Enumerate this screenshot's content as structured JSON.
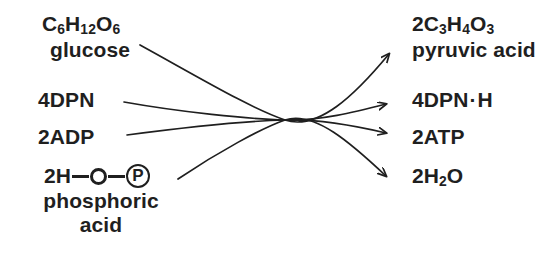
{
  "figure": {
    "type": "reaction-diagram",
    "background_color": "#ffffff",
    "ink_color": "#1f1f1f"
  },
  "reactants": [
    {
      "id": "glucose",
      "formula_parts": [
        "C",
        "6",
        "H",
        "12",
        "O",
        "6"
      ],
      "formula_plain": "C6H12O6",
      "name": "glucose"
    },
    {
      "id": "dpn",
      "formula_plain": "4DPN",
      "name": ""
    },
    {
      "id": "adp",
      "formula_plain": "2ADP",
      "name": ""
    },
    {
      "id": "phosphoric-acid",
      "formula_plain": "2H-O-(P)",
      "lead": "2H",
      "circle_o": "O",
      "circle_p": "P",
      "name_line1": "phosphoric",
      "name_line2": "acid"
    }
  ],
  "products": [
    {
      "id": "pyruvic-acid",
      "formula_parts": [
        "2C",
        "3",
        "H",
        "4",
        "O",
        "3"
      ],
      "formula_plain": "2C3H4O3",
      "name": "pyruvic acid"
    },
    {
      "id": "dpn-h",
      "formula_plain": "4DPN·H",
      "prefix": "4DPN",
      "dot": "·",
      "suffix": "H",
      "name": ""
    },
    {
      "id": "atp",
      "formula_plain": "2ATP",
      "name": ""
    },
    {
      "id": "water",
      "prefix": "2H",
      "sub": "2",
      "suffix": "O",
      "formula_plain": "2H2O",
      "name": ""
    }
  ],
  "arrows": [
    {
      "id": "arrow-glucose-to-pyruvic",
      "from": "glucose",
      "to": "pyruvic-acid"
    },
    {
      "id": "arrow-dpn-to-dpnh",
      "from": "dpn",
      "to": "dpn-h"
    },
    {
      "id": "arrow-adp-to-atp",
      "from": "adp",
      "to": "atp"
    },
    {
      "id": "arrow-phosphoric-to-water",
      "from": "phosphoric-acid",
      "to": "water"
    }
  ]
}
